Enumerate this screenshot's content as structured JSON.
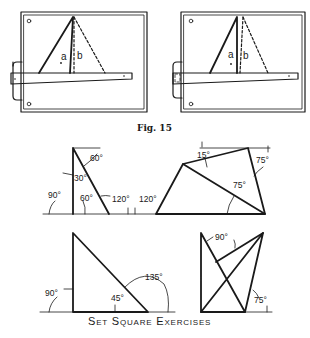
{
  "figure15": {
    "caption": "Fig. 15",
    "panels": [
      {
        "label_a": "a",
        "label_b": "b"
      },
      {
        "label_a": "a",
        "label_b": "b"
      }
    ]
  },
  "exercises": {
    "title": "Set Square Exercises",
    "angles": {
      "ex1": [
        "60°",
        "30°",
        "90°",
        "60°",
        "120°",
        "120°"
      ],
      "ex2": [
        "15°",
        "75°",
        "75°"
      ],
      "ex3": [
        "90°",
        "45°",
        "135°"
      ],
      "ex4": [
        "90°",
        "75°"
      ]
    }
  }
}
